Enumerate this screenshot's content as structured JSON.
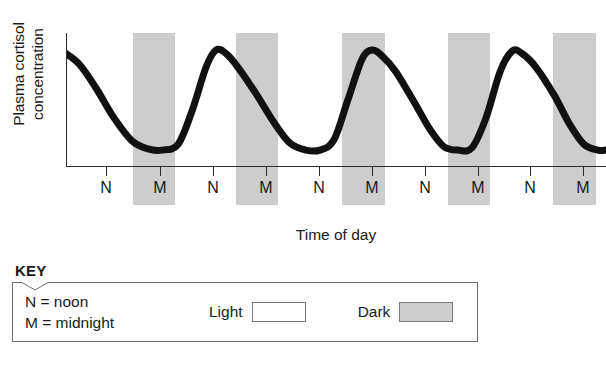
{
  "chart": {
    "ylabel_line1": "Plasma cortisol",
    "ylabel_line2": "concentration",
    "xlabel": "Time of day"
  },
  "key": {
    "title": "KEY",
    "noon_def": "N = noon",
    "midnight_def": "M = midnight",
    "light_label": "Light",
    "dark_label": "Dark"
  },
  "chart_data": {
    "type": "line",
    "title": "",
    "xlabel": "Time of day",
    "ylabel": "Plasma cortisol concentration",
    "grid": false,
    "legend_position": "below-plot",
    "axis_ticks_labeled": false,
    "ylim": [
      0,
      1
    ],
    "tick_labels": [
      "N",
      "M",
      "N",
      "M",
      "N",
      "M",
      "N",
      "M",
      "N",
      "M"
    ],
    "tick_meanings": [
      "noon",
      "midnight",
      "noon",
      "midnight",
      "noon",
      "midnight",
      "noon",
      "midnight",
      "noon",
      "midnight"
    ],
    "tick_positions_px": [
      106,
      160,
      213,
      266,
      319,
      372,
      425,
      478,
      530,
      583
    ],
    "shaded_bands": [
      {
        "label": "Dark",
        "start_px": 133,
        "end_px": 175
      },
      {
        "label": "Dark",
        "start_px": 236,
        "end_px": 278
      },
      {
        "label": "Dark",
        "start_px": 342,
        "end_px": 385
      },
      {
        "label": "Dark",
        "start_px": 448,
        "end_px": 490
      },
      {
        "label": "Dark",
        "start_px": 553,
        "end_px": 596
      }
    ],
    "band_color": "#cdcdcd",
    "line_color": "#111111",
    "line_width_px": 7,
    "series": [
      {
        "name": "Plasma cortisol concentration",
        "description": "Circadian rhythm: peaks just before/around waking (end of the dark period, early morning) and falls to a trough late in the day / early in the dark period.",
        "cycles": 5,
        "peak_relative_value": 0.93,
        "trough_relative_value": 0.06,
        "points": [
          {
            "x": 0,
            "y": 0.9
          },
          {
            "x": 14,
            "y": 0.8
          },
          {
            "x": 30,
            "y": 0.6
          },
          {
            "x": 48,
            "y": 0.34
          },
          {
            "x": 66,
            "y": 0.14
          },
          {
            "x": 82,
            "y": 0.07
          },
          {
            "x": 96,
            "y": 0.06
          },
          {
            "x": 112,
            "y": 0.11
          },
          {
            "x": 126,
            "y": 0.4
          },
          {
            "x": 140,
            "y": 0.78
          },
          {
            "x": 150,
            "y": 0.93
          },
          {
            "x": 160,
            "y": 0.9
          },
          {
            "x": 172,
            "y": 0.78
          },
          {
            "x": 190,
            "y": 0.55
          },
          {
            "x": 208,
            "y": 0.3
          },
          {
            "x": 224,
            "y": 0.12
          },
          {
            "x": 240,
            "y": 0.06
          },
          {
            "x": 254,
            "y": 0.06
          },
          {
            "x": 268,
            "y": 0.15
          },
          {
            "x": 282,
            "y": 0.5
          },
          {
            "x": 296,
            "y": 0.85
          },
          {
            "x": 306,
            "y": 0.93
          },
          {
            "x": 316,
            "y": 0.88
          },
          {
            "x": 330,
            "y": 0.74
          },
          {
            "x": 348,
            "y": 0.48
          },
          {
            "x": 364,
            "y": 0.24
          },
          {
            "x": 378,
            "y": 0.09
          },
          {
            "x": 392,
            "y": 0.06
          },
          {
            "x": 406,
            "y": 0.08
          },
          {
            "x": 420,
            "y": 0.34
          },
          {
            "x": 434,
            "y": 0.74
          },
          {
            "x": 446,
            "y": 0.92
          },
          {
            "x": 456,
            "y": 0.9
          },
          {
            "x": 470,
            "y": 0.78
          },
          {
            "x": 488,
            "y": 0.54
          },
          {
            "x": 504,
            "y": 0.28
          },
          {
            "x": 518,
            "y": 0.11
          },
          {
            "x": 532,
            "y": 0.06
          },
          {
            "x": 546,
            "y": 0.07
          },
          {
            "x": 558,
            "y": 0.2
          },
          {
            "x": 572,
            "y": 0.58
          },
          {
            "x": 586,
            "y": 0.85
          },
          {
            "x": 540,
            "y": 0.06
          }
        ]
      }
    ],
    "annotations": [
      {
        "text": "N",
        "meaning": "noon"
      },
      {
        "text": "M",
        "meaning": "midnight"
      }
    ]
  }
}
